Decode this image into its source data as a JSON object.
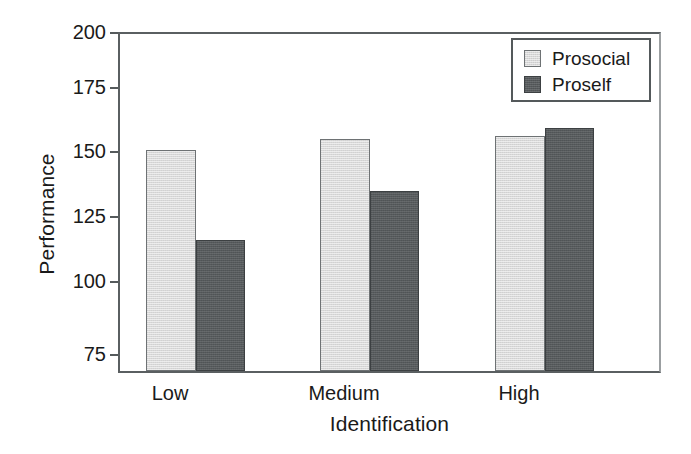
{
  "chart_data": {
    "type": "bar",
    "title": "",
    "subtitle": "",
    "xlabel": "Identification",
    "ylabel": "Performance",
    "categories": [
      "Low",
      "Medium",
      "High"
    ],
    "series": [
      {
        "name": "Prosocial",
        "values": [
          156,
          160,
          161
        ],
        "color": "#d8d8d8"
      },
      {
        "name": "Proself",
        "values": [
          123,
          141,
          164
        ],
        "color": "#565a5c"
      }
    ],
    "ylim": [
      75,
      200
    ],
    "yticks": [
      200,
      175,
      150,
      125,
      100,
      75
    ],
    "ytick_labels": [
      "200",
      "175",
      "150",
      "125",
      "100",
      "75"
    ],
    "grid": false,
    "legend_position": "top-right",
    "legend_entries": [
      "Prosocial",
      "Proself"
    ],
    "axis_color": "#54595b",
    "background": "#ffffff"
  }
}
